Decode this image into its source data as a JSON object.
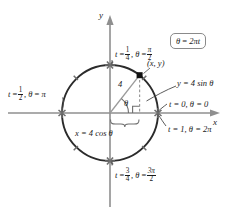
{
  "figure": {
    "type": "unit-circle-parametric-diagram",
    "radius_label": "4",
    "angle_symbol": "θ",
    "axes": {
      "x_label": "x",
      "y_label": "y"
    },
    "boxed_formula": {
      "lhs": "θ",
      "eq": "=",
      "rhs": "2πt",
      "full": "θ = 2πt"
    },
    "point_label": "(x, y)",
    "equations": {
      "y_component": "y = 4 sin θ",
      "x_component": "x = 4 cos θ"
    },
    "markers": [
      {
        "id": "top",
        "t_var": "t",
        "t_eq": "=",
        "t_num": "1",
        "t_den": "4",
        "theta_var": "θ",
        "theta_eq": "=",
        "theta_num": "π",
        "theta_den": "2",
        "full": "t = 1/4, θ = π/2"
      },
      {
        "id": "left",
        "t_var": "t",
        "t_eq": "=",
        "t_num": "1",
        "t_den": "2",
        "theta_var": "θ",
        "theta_eq": "=",
        "theta_plain": "π",
        "full": "t = 1/2, θ = π"
      },
      {
        "id": "bottom",
        "t_var": "t",
        "t_eq": "=",
        "t_num": "3",
        "t_den": "4",
        "theta_var": "θ",
        "theta_eq": "=",
        "theta_num": "3π",
        "theta_den": "2",
        "full": "t = 3/4, θ = 3π/2"
      },
      {
        "id": "right-start",
        "plain": "t = 0, θ = 0"
      },
      {
        "id": "right-end",
        "plain": "t = 1, θ = 2π"
      }
    ],
    "colors": {
      "ink": "#1a1a1a",
      "circle_stroke": "#2b2b2b",
      "axis_stroke": "#8f8f8f",
      "helper_stroke": "#9a9a9a",
      "box_border": "#8a8a8a",
      "marker_fill": "#6e6e6e",
      "point_fill": "#111111",
      "background": "#ffffff"
    },
    "geometry": {
      "center_x": 110,
      "center_y": 113,
      "radius": 48,
      "point_angle_deg": 52
    }
  }
}
